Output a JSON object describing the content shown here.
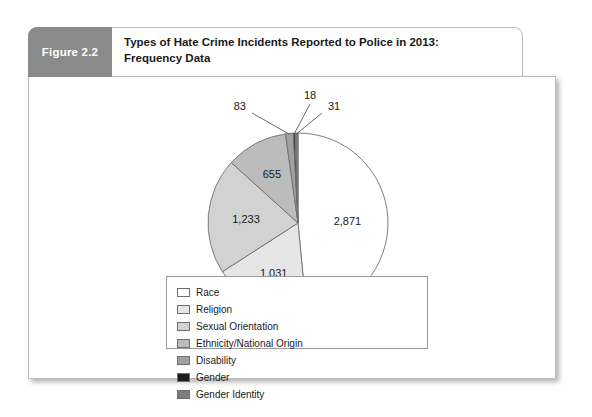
{
  "figure": {
    "tab_label": "Figure 2.2",
    "title_line1": "Types of Hate Crime Incidents Reported to Police in 2013:",
    "title_line2": "Frequency Data"
  },
  "chart_data": {
    "type": "pie",
    "title": "Types of Hate Crime Incidents Reported to Police in 2013: Frequency Data",
    "total": 5922,
    "legend_position": "bottom",
    "categories": [
      "Race",
      "Religion",
      "Sexual Orientation",
      "Ethnicity/National Origin",
      "Disability",
      "Gender",
      "Gender Identity"
    ],
    "values": [
      2871,
      1031,
      1233,
      655,
      83,
      18,
      31
    ],
    "labels": [
      "2,871",
      "1,031",
      "1,233",
      "655",
      "83",
      "18",
      "31"
    ],
    "colors": [
      "#ffffff",
      "#e6e6e6",
      "#d2d2d2",
      "#bcbcbc",
      "#a0a0a0",
      "#1c1c1c",
      "#7d7d7d"
    ],
    "slice_border": "#6f6f6f"
  },
  "legend": {
    "entries": [
      {
        "label": "Race",
        "color": "#ffffff"
      },
      {
        "label": "Religion",
        "color": "#e6e6e6"
      },
      {
        "label": "Sexual Orientation",
        "color": "#d2d2d2"
      },
      {
        "label": "Ethnicity/National Origin",
        "color": "#bcbcbc"
      },
      {
        "label": "Disability",
        "color": "#a0a0a0"
      },
      {
        "label": "Gender",
        "color": "#1c1c1c"
      },
      {
        "label": "Gender Identity",
        "color": "#7d7d7d"
      }
    ]
  }
}
